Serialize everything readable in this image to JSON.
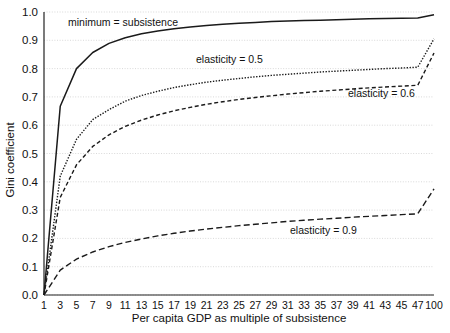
{
  "chart_data": {
    "type": "line",
    "title": "",
    "xlabel": "Per capita GDP as multiple of subsistence",
    "ylabel": "Gini coefficient",
    "ylim": [
      0.0,
      1.0
    ],
    "ytick_labels": [
      "0.0",
      "0.1",
      "0.2",
      "0.3",
      "0.4",
      "0.5",
      "0.6",
      "0.7",
      "0.8",
      "0.9",
      "1.0"
    ],
    "ytick_values": [
      0.0,
      0.1,
      0.2,
      0.3,
      0.4,
      0.5,
      0.6,
      0.7,
      0.8,
      0.9,
      1.0
    ],
    "grid": true,
    "grid_axis": "y",
    "legend_position": "inline-annotations",
    "x_axis_type": "categorical-uneven",
    "xtick_labels": [
      "1",
      "3",
      "5",
      "7",
      "9",
      "11",
      "13",
      "15",
      "17",
      "19",
      "21",
      "23",
      "25",
      "27",
      "29",
      "31",
      "33",
      "35",
      "37",
      "39",
      "41",
      "43",
      "45",
      "47",
      "100"
    ],
    "x": [
      1,
      3,
      5,
      7,
      9,
      11,
      13,
      15,
      17,
      19,
      21,
      23,
      25,
      27,
      29,
      31,
      33,
      35,
      37,
      39,
      41,
      43,
      45,
      47,
      100
    ],
    "series": [
      {
        "name": "minimum = subsistence",
        "style": "solid",
        "color": "#1a1a1a",
        "values": [
          0.0,
          0.667,
          0.8,
          0.857,
          0.889,
          0.909,
          0.923,
          0.933,
          0.941,
          0.947,
          0.952,
          0.957,
          0.96,
          0.963,
          0.966,
          0.968,
          0.97,
          0.971,
          0.973,
          0.974,
          0.976,
          0.977,
          0.978,
          0.979,
          0.99
        ]
      },
      {
        "name": "elasticity = 0.5",
        "style": "dotted",
        "color": "#1a1a1a",
        "values": [
          0.0,
          0.42,
          0.55,
          0.62,
          0.655,
          0.685,
          0.705,
          0.72,
          0.733,
          0.743,
          0.752,
          0.759,
          0.765,
          0.771,
          0.776,
          0.78,
          0.784,
          0.788,
          0.791,
          0.794,
          0.797,
          0.8,
          0.802,
          0.805,
          0.905
        ]
      },
      {
        "name": "elasticity = 0.6",
        "style": "dashed",
        "color": "#1a1a1a",
        "values": [
          0.0,
          0.345,
          0.46,
          0.525,
          0.566,
          0.596,
          0.618,
          0.636,
          0.651,
          0.663,
          0.674,
          0.683,
          0.691,
          0.698,
          0.704,
          0.71,
          0.715,
          0.72,
          0.724,
          0.728,
          0.732,
          0.735,
          0.738,
          0.741,
          0.855
        ]
      },
      {
        "name": "elasticity = 0.9",
        "style": "dashed-long",
        "color": "#1a1a1a",
        "values": [
          0.0,
          0.088,
          0.127,
          0.152,
          0.171,
          0.186,
          0.198,
          0.209,
          0.218,
          0.226,
          0.233,
          0.239,
          0.245,
          0.25,
          0.255,
          0.26,
          0.264,
          0.268,
          0.271,
          0.275,
          0.278,
          0.281,
          0.284,
          0.287,
          0.375
        ]
      }
    ],
    "annotations": [
      {
        "text": "minimum = subsistence",
        "x_px": 68,
        "y_px": 26,
        "anchor": "start"
      },
      {
        "text": "elasticity = 0.5",
        "x_px": 196,
        "y_px": 63,
        "anchor": "start"
      },
      {
        "text": "elasticity = 0.6",
        "x_px": 348,
        "y_px": 97,
        "anchor": "start"
      },
      {
        "text": "elasticity = 0.9",
        "x_px": 290,
        "y_px": 234,
        "anchor": "start"
      }
    ]
  }
}
